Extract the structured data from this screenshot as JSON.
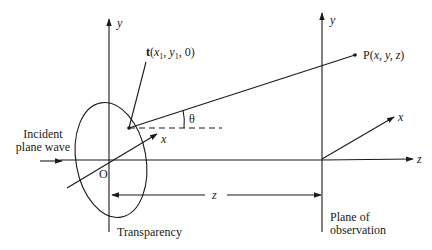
{
  "diagram": {
    "colors": {
      "ink": "#1a1a1a",
      "background": "#ffffff"
    },
    "left_axes": {
      "y_label": "y",
      "x_label": "x",
      "origin_label": "O"
    },
    "right_axes": {
      "y_label": "y",
      "x_label": "x",
      "z_label": "z"
    },
    "point_t": {
      "prefix": "t",
      "open": "(",
      "x": "x",
      "x_sub": "1",
      "sep1": ", ",
      "y": "y",
      "y_sub": "1",
      "sep2": ", 0)"
    },
    "point_p": {
      "prefix": "P(",
      "coords": "x, y, z",
      "close": ")"
    },
    "angle_label": "θ",
    "distance_label": "z",
    "incident_label": [
      "Incident",
      "plane wave"
    ],
    "transparency_label": "Transparency",
    "observation_label": [
      "Plane of",
      "observation"
    ]
  }
}
